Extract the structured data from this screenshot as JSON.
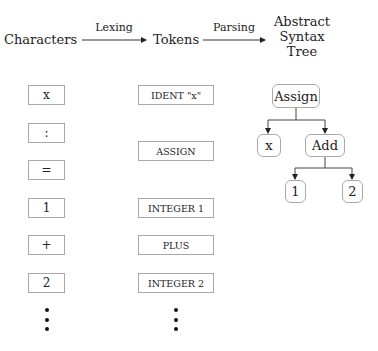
{
  "header": {
    "stage1": "Characters",
    "edge1": "Lexing",
    "stage2": "Tokens",
    "edge2": "Parsing",
    "stage3_line1": "Abstract",
    "stage3_line2": "Syntax",
    "stage3_line3": "Tree"
  },
  "characters": [
    {
      "label": "x"
    },
    {
      "label": ":"
    },
    {
      "label": "="
    },
    {
      "label": "1"
    },
    {
      "label": "+"
    },
    {
      "label": "2"
    }
  ],
  "tokens": [
    {
      "label": "IDENT \"x\""
    },
    {
      "label": "ASSIGN"
    },
    {
      "label": "INTEGER 1"
    },
    {
      "label": "PLUS"
    },
    {
      "label": "INTEGER 2"
    }
  ],
  "ast": {
    "root": "Assign",
    "left": "x",
    "right": "Add",
    "right_left": "1",
    "right_right": "2"
  },
  "ellipsis_icon": "vertical-ellipsis"
}
